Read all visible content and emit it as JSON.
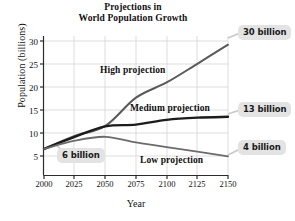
{
  "chart_data": {
    "type": "line",
    "title": "Projections in World Population Growth",
    "title_lines": [
      "Projections in",
      "World Population Growth"
    ],
    "xlabel": "Year",
    "ylabel": "Population (billions)",
    "xlim": [
      2000,
      2150
    ],
    "ylim": [
      0,
      32
    ],
    "grid": true,
    "legend": "inline-labels",
    "xticks": [
      "2000",
      "2025",
      "2050",
      "2075",
      "2100",
      "2125",
      "2150"
    ],
    "xtick_values": [
      2000,
      2025,
      2050,
      2075,
      2100,
      2125,
      2150
    ],
    "yticks": [
      "5",
      "10",
      "15",
      "20",
      "25",
      "30"
    ],
    "ytick_values": [
      5,
      10,
      15,
      20,
      25,
      30
    ],
    "x": [
      2000,
      2025,
      2050,
      2075,
      2100,
      2125,
      2150
    ],
    "series": [
      {
        "name": "High projection",
        "color": "#595959",
        "width": 2.0,
        "values": [
          6,
          9,
          11.3,
          17.8,
          21.3,
          25.6,
          30
        ]
      },
      {
        "name": "Medium projection",
        "color": "#1c1c1c",
        "width": 2.4,
        "values": [
          6,
          8.8,
          11.2,
          11.6,
          12.7,
          13.2,
          13.4
        ]
      },
      {
        "name": "Low projection",
        "color": "#6b6b6b",
        "width": 1.8,
        "values": [
          6,
          7.9,
          8.8,
          7.5,
          6.4,
          5.4,
          4.3
        ]
      }
    ],
    "annotations": [
      {
        "text": "6 billion",
        "value": 6,
        "at_year": 2000,
        "position": "left-inside"
      },
      {
        "text": "30 billion",
        "value": 30,
        "at_year": 2150,
        "position": "right-top"
      },
      {
        "text": "13 billion",
        "value": 13.4,
        "at_year": 2150,
        "position": "right-middle"
      },
      {
        "text": "4 billion",
        "value": 4.3,
        "at_year": 2150,
        "position": "right-bottom"
      }
    ],
    "series_labels": [
      {
        "text": "High projection",
        "x_frac": 0.3,
        "y_frac": 0.22
      },
      {
        "text": "Medium projection",
        "x_frac": 0.46,
        "y_frac": 0.47
      },
      {
        "text": "Low projection",
        "x_frac": 0.54,
        "y_frac": 0.76
      }
    ],
    "colors": {
      "axis": "#2b2b2b",
      "grid": "#d0d0d0",
      "callout_bg": "#e3e3e3",
      "text": "#111111"
    }
  }
}
